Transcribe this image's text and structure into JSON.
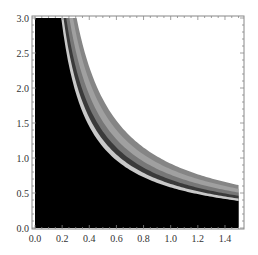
{
  "chart_data": {
    "type": "area",
    "title": "",
    "xlabel": "",
    "ylabel": "",
    "xlim": [
      0.0,
      1.5
    ],
    "ylim": [
      0.0,
      3.0
    ],
    "x_ticks": [
      "0.0",
      "0.2",
      "0.4",
      "0.6",
      "0.8",
      "1.0",
      "1.2",
      "1.4"
    ],
    "y_ticks": [
      "0.0",
      "0.5",
      "1.0",
      "1.5",
      "2.0",
      "2.5",
      "3.0"
    ],
    "grid": false,
    "legend": null,
    "series": [
      {
        "name": "filled-region",
        "color": "#000000",
        "curve": "y = 0.58/x",
        "c": 0.58
      },
      {
        "name": "band-1-light",
        "color": "#c9c9c9",
        "c_from": 0.58,
        "c_to": 0.63
      },
      {
        "name": "band-2-dark",
        "color": "#3a3a3a",
        "c_from": 0.63,
        "c_to": 0.69
      },
      {
        "name": "band-3-gray",
        "color": "#777777",
        "c_from": 0.69,
        "c_to": 0.76
      },
      {
        "name": "band-4-lightgray",
        "color": "#a0a0a0",
        "c_from": 0.76,
        "c_to": 0.84
      },
      {
        "name": "band-5-midgray",
        "color": "#858585",
        "c_from": 0.84,
        "c_to": 0.92
      }
    ]
  },
  "axes": {
    "x_labels": [
      "0.0",
      "0.2",
      "0.4",
      "0.6",
      "0.8",
      "1.0",
      "1.2",
      "1.4"
    ],
    "y_labels": [
      "0.0",
      "0.5",
      "1.0",
      "1.5",
      "2.0",
      "2.5",
      "3.0"
    ]
  }
}
